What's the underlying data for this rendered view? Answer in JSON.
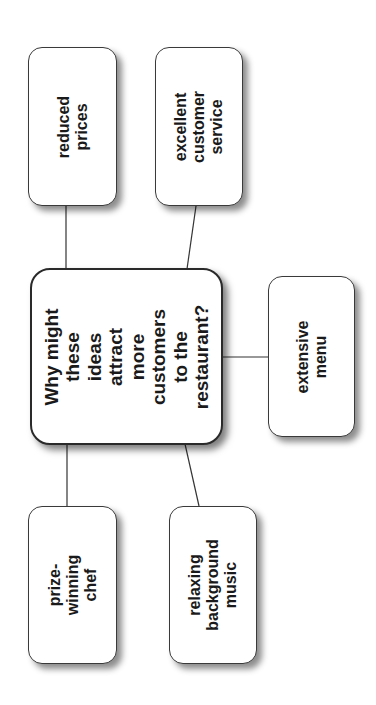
{
  "diagram": {
    "type": "concept-map",
    "orientation": "rotated-90-ccw",
    "central": {
      "text": "Why might these\nideas attract more\ncustomers to the\nrestaurant?"
    },
    "ideas": [
      {
        "id": "reduced-prices",
        "text": "reduced prices"
      },
      {
        "id": "excellent-customer-service",
        "text": "excellent\ncustomer\nservice"
      },
      {
        "id": "extensive-menu",
        "text": "extensive menu"
      },
      {
        "id": "prize-winning-chef",
        "text": "prize-winning\nchef"
      },
      {
        "id": "relaxing-background-music",
        "text": "relaxing\nbackground\nmusic"
      }
    ],
    "colors": {
      "background": "#ffffff",
      "border": "#3a3a3a",
      "text": "#1a1a1a",
      "connector": "#333333"
    }
  }
}
